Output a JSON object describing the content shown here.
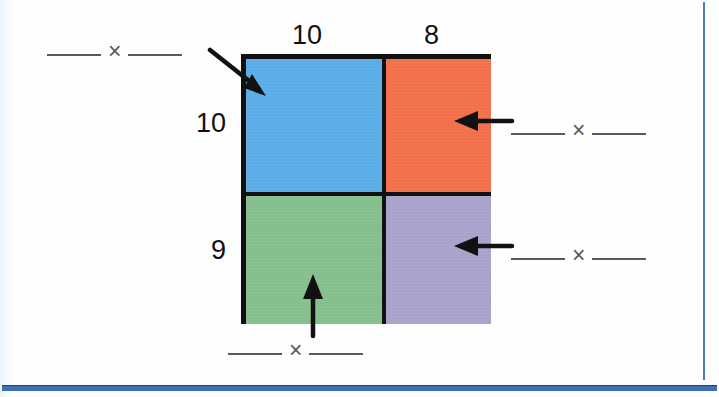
{
  "diagram": {
    "type": "area-model-multiplication",
    "dimensions": {
      "top_labels": [
        "10",
        "8"
      ],
      "left_labels": [
        "10",
        "9"
      ]
    },
    "cells": [
      {
        "name": "top-left",
        "color": "#5aade7",
        "width_label": "10",
        "height_label": "10"
      },
      {
        "name": "top-right",
        "color": "#f2704a",
        "width_label": "8",
        "height_label": "10"
      },
      {
        "name": "bottom-left",
        "color": "#85bf8d",
        "width_label": "10",
        "height_label": "9"
      },
      {
        "name": "bottom-right",
        "color": "#a9a3cc",
        "width_label": "8",
        "height_label": "9"
      }
    ],
    "answer_prompts": [
      {
        "id": "top-left",
        "blank_left": "",
        "operator": "×",
        "blank_right": "",
        "points_to": "top-left-cell",
        "arrow": "diagonal-down-right"
      },
      {
        "id": "top-right",
        "blank_left": "",
        "operator": "×",
        "blank_right": "",
        "points_to": "top-right-cell",
        "arrow": "left"
      },
      {
        "id": "bottom-right",
        "blank_left": "",
        "operator": "×",
        "blank_right": "",
        "points_to": "bottom-right-cell",
        "arrow": "left"
      },
      {
        "id": "bottom-left",
        "blank_left": "",
        "operator": "×",
        "blank_right": "",
        "points_to": "bottom-left-cell",
        "arrow": "up"
      }
    ],
    "colors": {
      "blue": "#5aade7",
      "orange": "#f2704a",
      "green": "#85bf8d",
      "purple": "#a9a3cc",
      "outline": "#111111",
      "blank_line": "#5a5a5a",
      "page_rule": "#3c6fb5"
    }
  }
}
